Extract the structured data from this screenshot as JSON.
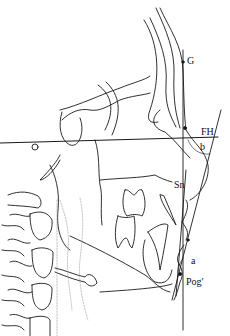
{
  "figure": {
    "type": "cephalometric-tracing",
    "labels": {
      "glabella": "G",
      "frankfort_horizontal": "FH",
      "angle_b": "b",
      "subnasale": "Sn",
      "angle_a": "a",
      "soft_pogonion": "Pog′"
    },
    "colors": {
      "line": "#1a1a1a",
      "background": "#ffffff",
      "dotted": "#999999"
    }
  }
}
